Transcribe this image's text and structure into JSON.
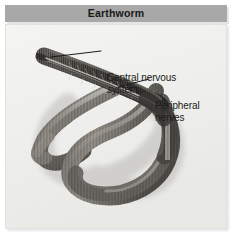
{
  "figure": {
    "title": "Earthworm",
    "background_color": "#ffffff",
    "title_band_color": "#a8a8a8",
    "title_text_color": "#181818",
    "plate_background_color": "#f2f2f0",
    "label_text_color": "#1b1b1b"
  },
  "photo": {
    "subject": "earthworm-dissection",
    "description": "Grayscale photograph of a dissected earthworm specimen coiled in an S-curve, with the anterior dorsal surface opened to expose the nerve cord.",
    "body_color_dark": "#4a4845",
    "body_color_mid": "#7d7a75",
    "body_color_light": "#b4b0aa",
    "background_color": "#f2f2f0"
  },
  "callouts": [
    {
      "id": "central-nervous-system",
      "label": "Central nervous\nsystem",
      "leader_from": [
        69,
        56
      ],
      "leader_to": [
        99,
        50
      ]
    },
    {
      "id": "peripheral-nerves",
      "label": "Peripheral\nnerves",
      "leader_from": [
        118,
        86
      ],
      "leader_to": [
        147,
        78
      ]
    }
  ]
}
